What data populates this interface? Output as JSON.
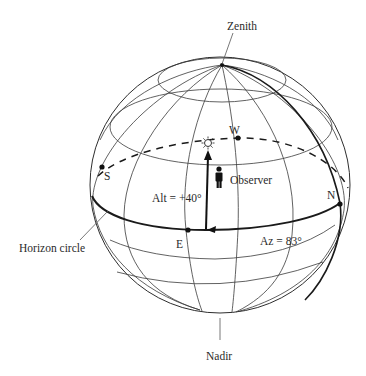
{
  "figure": {
    "type": "celestial-sphere-horizon-coordinates",
    "labels": {
      "zenith": "Zenith",
      "nadir": "Nadir",
      "horizon_circle": "Horizon circle",
      "observer": "Observer",
      "altitude": "Alt = +40°",
      "azimuth": "Az = 83°"
    },
    "cardinal_points": {
      "north": "N",
      "south": "S",
      "east": "E",
      "west": "W"
    },
    "values": {
      "altitude_deg": 40,
      "azimuth_deg": 83
    },
    "icons": {
      "sun": "sun-icon",
      "observer": "person-icon"
    },
    "colors": {
      "line": "#1a1a1a",
      "grid": "#3a3a3a",
      "background": "#ffffff"
    }
  }
}
